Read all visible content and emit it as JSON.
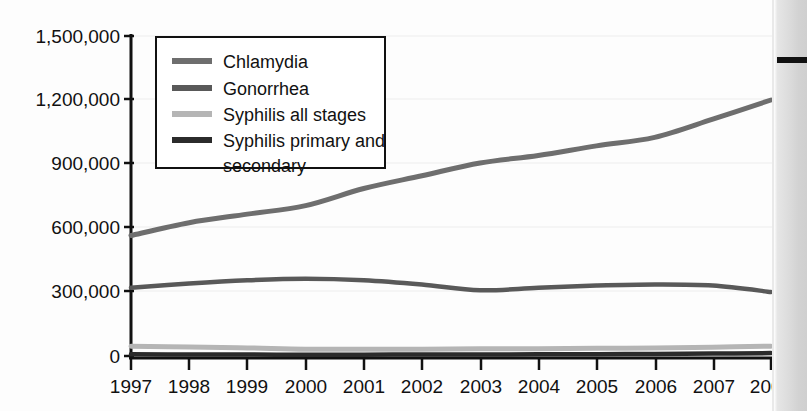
{
  "chart_data": {
    "type": "line",
    "title": "",
    "subtitle": "",
    "xlabel": "",
    "ylabel": "",
    "x": [
      1997,
      1998,
      1999,
      2000,
      2001,
      2002,
      2003,
      2004,
      2005,
      2006,
      2007,
      2008
    ],
    "xtick_labels": [
      "1997",
      "1998",
      "1999",
      "2000",
      "2001",
      "2002",
      "2003",
      "2004",
      "2005",
      "2006",
      "2007",
      "2008"
    ],
    "ytick_labels": [
      "0",
      "300,000",
      "600,000",
      "900,000",
      "1,200,000",
      "1,500,000"
    ],
    "ytick_values": [
      0,
      300000,
      600000,
      900000,
      1200000,
      1500000
    ],
    "ylim": [
      0,
      1500000
    ],
    "xlim": [
      1997,
      2008
    ],
    "grid": true,
    "grid_axis": "y",
    "legend_position": "upper left inside",
    "series": [
      {
        "name": "Chlamydia",
        "color": "#6e6e6e",
        "width": 5,
        "values": [
          565000,
          625000,
          665000,
          705000,
          785000,
          845000,
          905000,
          940000,
          985000,
          1025000,
          1110000,
          1200000
        ]
      },
      {
        "name": "Gonorrhea",
        "color": "#595959",
        "width": 4.5,
        "values": [
          320000,
          340000,
          355000,
          362000,
          355000,
          335000,
          308000,
          320000,
          330000,
          335000,
          330000,
          300000
        ]
      },
      {
        "name": "Syphilis all stages",
        "color": "#b5b5b5",
        "width": 5,
        "values": [
          46000,
          42000,
          38000,
          32000,
          32000,
          32000,
          34000,
          34000,
          36000,
          37000,
          41000,
          46000
        ]
      },
      {
        "name": "Syphilis primary and secondary",
        "color": "#2b2b2b",
        "width": 4.5,
        "values": [
          8500,
          7000,
          6700,
          6000,
          6100,
          6900,
          7200,
          7900,
          8700,
          9800,
          11500,
          13500
        ]
      }
    ]
  },
  "legend": {
    "entries": [
      {
        "label": "Chlamydia",
        "color": "#6e6e6e"
      },
      {
        "label": "Gonorrhea",
        "color": "#595959"
      },
      {
        "label": "Syphilis all stages",
        "color": "#b5b5b5"
      },
      {
        "label": "Syphilis primary and",
        "color": "#2b2b2b"
      },
      {
        "label": "secondary",
        "color": ""
      }
    ]
  }
}
